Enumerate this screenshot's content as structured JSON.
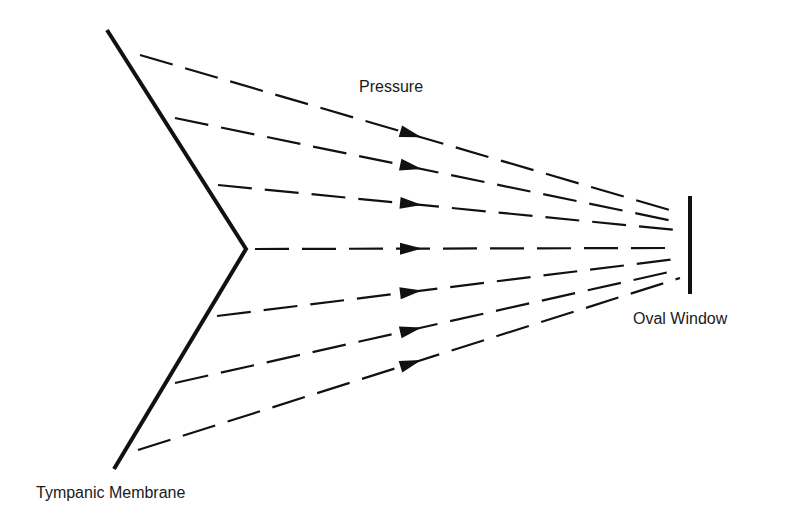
{
  "labels": {
    "pressure": "Pressure",
    "oval_window": "Oval Window",
    "tympanic_membrane": "Tympanic Membrane"
  },
  "colors": {
    "ink": "#111111",
    "background": "#ffffff"
  },
  "diagram": {
    "membrane": {
      "top": [
        107,
        30
      ],
      "vertex": [
        246,
        249
      ],
      "bottom": [
        114,
        469
      ]
    },
    "oval_window": {
      "x": 690,
      "y1": 196,
      "y2": 294
    },
    "pressure_lines": [
      {
        "from": [
          140,
          55
        ],
        "to": [
          680,
          213
        ],
        "arrow_x": 410
      },
      {
        "from": [
          175,
          118
        ],
        "to": [
          678,
          222
        ],
        "arrow_x": 410
      },
      {
        "from": [
          218,
          185
        ],
        "to": [
          676,
          230
        ],
        "arrow_x": 410
      },
      {
        "from": [
          255,
          249
        ],
        "to": [
          668,
          248
        ],
        "arrow_x": 410
      },
      {
        "from": [
          217,
          316
        ],
        "to": [
          676,
          259
        ],
        "arrow_x": 410
      },
      {
        "from": [
          175,
          383
        ],
        "to": [
          678,
          270
        ],
        "arrow_x": 410
      },
      {
        "from": [
          138,
          450
        ],
        "to": [
          680,
          278
        ],
        "arrow_x": 410
      }
    ]
  }
}
